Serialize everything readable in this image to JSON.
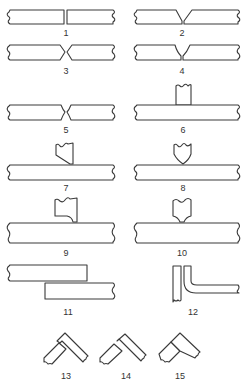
{
  "diagram": {
    "type": "weld-joint-types",
    "line_color": "#3a3a3a",
    "background": "#ffffff",
    "figures": [
      {
        "id": 1,
        "label": "1",
        "kind": "butt-joint-square"
      },
      {
        "id": 2,
        "label": "2",
        "kind": "butt-joint-single-v"
      },
      {
        "id": 3,
        "label": "3",
        "kind": "butt-joint-double-v"
      },
      {
        "id": 4,
        "label": "4",
        "kind": "butt-joint-single-j-u"
      },
      {
        "id": 5,
        "label": "5",
        "kind": "butt-joint-double-v-close"
      },
      {
        "id": 6,
        "label": "6",
        "kind": "tee-joint-square"
      },
      {
        "id": 7,
        "label": "7",
        "kind": "tee-joint-single-bevel"
      },
      {
        "id": 8,
        "label": "8",
        "kind": "tee-joint-double-bevel"
      },
      {
        "id": 9,
        "label": "9",
        "kind": "tee-joint-single-j"
      },
      {
        "id": 10,
        "label": "10",
        "kind": "tee-joint-double-j"
      },
      {
        "id": 11,
        "label": "11",
        "kind": "lap-joint"
      },
      {
        "id": 12,
        "label": "12",
        "kind": "edge-flange-joint"
      },
      {
        "id": 13,
        "label": "13",
        "kind": "corner-joint-full-open"
      },
      {
        "id": 14,
        "label": "14",
        "kind": "corner-joint-half-open"
      },
      {
        "id": 15,
        "label": "15",
        "kind": "corner-joint-closed"
      }
    ]
  }
}
